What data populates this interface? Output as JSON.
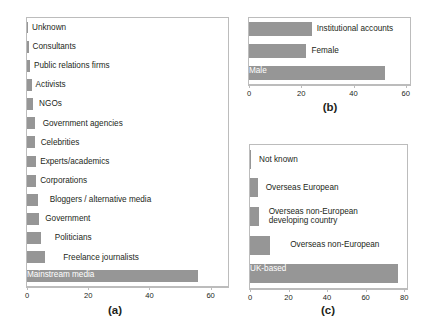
{
  "figure": {
    "background": "#ffffff",
    "bar_color": "#969696",
    "axis_color": "#bcbcbc",
    "text_color": "#231f20"
  },
  "chart_data": [
    {
      "id": "a",
      "type": "bar",
      "orientation": "horizontal",
      "title": "",
      "caption": "(a)",
      "xlabel": "",
      "ylabel": "",
      "xlim": [
        0,
        66
      ],
      "xticks": [
        0,
        20,
        40,
        60
      ],
      "xtick_labels": [
        "0",
        "20",
        "40",
        "60"
      ],
      "grid": false,
      "legend": "none",
      "categories": [
        "Unknown",
        "Consultants",
        "Public relations firms",
        "Activists",
        "NGOs",
        "Government agencies",
        "Celebrities",
        "Experts/academics",
        "Corporations",
        "Bloggers / alternative media",
        "Government",
        "Politicians",
        "Freelance journalists",
        "Mainstream media"
      ],
      "values": [
        0.2,
        0.5,
        1,
        1.5,
        2,
        2.5,
        2.5,
        3,
        3,
        3.5,
        4,
        4.5,
        6,
        56
      ],
      "label_placement": [
        "outside",
        "outside",
        "outside",
        "outside",
        "outside",
        "outside",
        "outside",
        "outside",
        "outside",
        "outside",
        "outside",
        "outside",
        "outside",
        "inside"
      ]
    },
    {
      "id": "b",
      "type": "bar",
      "orientation": "horizontal",
      "title": "",
      "caption": "(b)",
      "xlabel": "",
      "ylabel": "",
      "xlim": [
        0,
        62
      ],
      "xticks": [
        0,
        20,
        40,
        60
      ],
      "xtick_labels": [
        "0",
        "20",
        "40",
        "60"
      ],
      "grid": false,
      "legend": "none",
      "categories": [
        "Institutional accounts",
        "Female",
        "Male"
      ],
      "values": [
        24,
        22,
        52
      ],
      "label_placement": [
        "outside",
        "outside",
        "inside"
      ]
    },
    {
      "id": "c",
      "type": "bar",
      "orientation": "horizontal",
      "title": "",
      "caption": "(c)",
      "xlabel": "",
      "ylabel": "",
      "xlim": [
        0,
        82
      ],
      "xticks": [
        0,
        20,
        40,
        60,
        80
      ],
      "xtick_labels": [
        "0",
        "20",
        "40",
        "60",
        "80"
      ],
      "grid": false,
      "legend": "none",
      "categories": [
        "Not known",
        "Overseas European",
        "Overseas non-European developing country",
        "Overseas non-European",
        "UK-based"
      ],
      "values": [
        0.5,
        4,
        4.5,
        10.5,
        77
      ],
      "label_placement": [
        "outside",
        "outside",
        "outside",
        "outside",
        "inside"
      ]
    }
  ],
  "panel_a": {
    "caption": "(a)",
    "bars": [
      {
        "label": "Unknown",
        "value": 0.2
      },
      {
        "label": "Consultants",
        "value": 0.5
      },
      {
        "label": "Public relations firms",
        "value": 1
      },
      {
        "label": "Activists",
        "value": 1.5
      },
      {
        "label": "NGOs",
        "value": 2
      },
      {
        "label": "Government agencies",
        "value": 2.5
      },
      {
        "label": "Celebrities",
        "value": 2.5
      },
      {
        "label": "Experts/academics",
        "value": 3
      },
      {
        "label": "Corporations",
        "value": 3
      },
      {
        "label": "Bloggers / alternative media",
        "value": 3.5
      },
      {
        "label": "Government",
        "value": 4
      },
      {
        "label": "Politicians",
        "value": 4.5
      },
      {
        "label": "Freelance journalists",
        "value": 6
      },
      {
        "label": "Mainstream media",
        "value": 56
      }
    ],
    "ticks": [
      "0",
      "20",
      "40",
      "60"
    ]
  },
  "panel_b": {
    "caption": "(b)",
    "bars": [
      {
        "label": "Institutional accounts",
        "value": 24
      },
      {
        "label": "Female",
        "value": 22
      },
      {
        "label": "Male",
        "value": 52
      }
    ],
    "ticks": [
      "0",
      "20",
      "40",
      "60"
    ]
  },
  "panel_c": {
    "caption": "(c)",
    "bars": [
      {
        "label": "Not known",
        "value": 0.5
      },
      {
        "label": "Overseas European",
        "value": 4
      },
      {
        "label": "Overseas non-European developing country",
        "value": 4.5
      },
      {
        "label": "Overseas non-European",
        "value": 10.5
      },
      {
        "label": "UK-based",
        "value": 77
      }
    ],
    "ticks": [
      "0",
      "20",
      "40",
      "60",
      "80"
    ]
  }
}
